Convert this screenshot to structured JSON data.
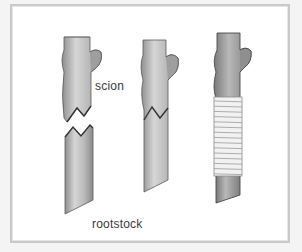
{
  "figure": {
    "labels": {
      "scion": "scion",
      "rootstock": "rootstock"
    },
    "stages": [
      {
        "name": "separated",
        "description": "scion and rootstock cut with matching tongues"
      },
      {
        "name": "joined",
        "description": "scion and rootstock fitted together"
      },
      {
        "name": "wrapped",
        "description": "graft union bound with wrapping"
      }
    ],
    "colors": {
      "stem_fill": "#b4b4b4",
      "stem_highlight": "#d2d2d2",
      "stem_outline": "#5a5a5a",
      "wrap_fill": "#f2f2f2",
      "wrap_line": "#9a9a9a",
      "frame": "#c9c9c9"
    }
  }
}
